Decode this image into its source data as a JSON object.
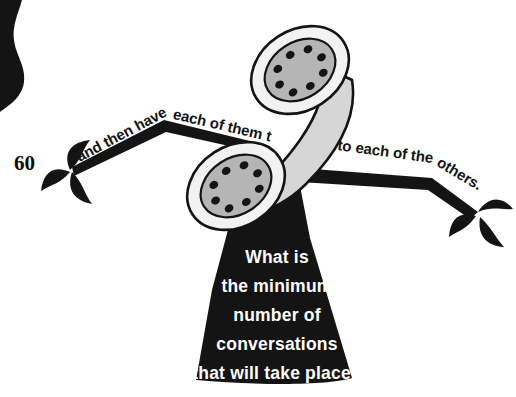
{
  "page": {
    "number": "60",
    "background_color": "#ffffff",
    "ink_color": "#141414",
    "highlight_text_color": "#ffffff"
  },
  "banners": {
    "left": {
      "text": "and then have each of them talk",
      "color": "#141414"
    },
    "right": {
      "text": "to each of  the others.",
      "color": "#141414"
    }
  },
  "question": {
    "lines": [
      "What is",
      "the minimum",
      "number of",
      "conversations",
      "that will take place?"
    ],
    "panel_color": "#141414",
    "text_color": "#ffffff"
  },
  "illustration": {
    "name": "telephone-handset",
    "body_color": "#d6d6d6",
    "outline_color": "#141414",
    "earpiece_face_color": "#b5b5b5",
    "earpiece_rim_color": "#f2f2f2",
    "hole_count": 8,
    "parts": [
      "upper-earpiece",
      "lower-earpiece",
      "handle"
    ]
  },
  "decorations": {
    "leaf_clusters": [
      {
        "name": "left-leaf-cluster",
        "leaves": 3
      },
      {
        "name": "right-leaf-cluster",
        "leaves": 3
      }
    ],
    "corner_blot": {
      "name": "page-edge-blot",
      "color": "#141414"
    }
  }
}
